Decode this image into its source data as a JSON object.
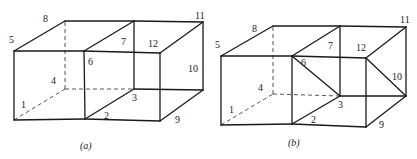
{
  "figures": [
    {
      "id": "a",
      "caption": "(a)",
      "caption_pos": [
        80,
        149
      ],
      "vertices": {
        "1": [
          14,
          120
        ],
        "2": [
          85,
          119
        ],
        "3": [
          134,
          89
        ],
        "4": [
          65,
          89
        ],
        "5": [
          14,
          51
        ],
        "6": [
          84,
          51
        ],
        "7": [
          134,
          21
        ],
        "8": [
          65,
          21
        ],
        "9": [
          160,
          121
        ],
        "10": [
          203,
          90
        ],
        "11": [
          203,
          22
        ],
        "12": [
          160,
          53
        ]
      },
      "labels": [
        {
          "text": "1",
          "x": 21,
          "y": 108
        },
        {
          "text": "2",
          "x": 104,
          "y": 119
        },
        {
          "text": "3",
          "x": 132,
          "y": 101
        },
        {
          "text": "4",
          "x": 51,
          "y": 84
        },
        {
          "text": "5",
          "x": 9,
          "y": 43
        },
        {
          "text": "6",
          "x": 88,
          "y": 65
        },
        {
          "text": "7",
          "x": 121,
          "y": 45
        },
        {
          "text": "8",
          "x": 43,
          "y": 22
        },
        {
          "text": "9",
          "x": 175,
          "y": 123
        },
        {
          "text": "10",
          "x": 188,
          "y": 72
        },
        {
          "text": "11",
          "x": 195,
          "y": 19
        },
        {
          "text": "12",
          "x": 148,
          "y": 47
        }
      ],
      "solid_edges": [
        [
          "5",
          "6"
        ],
        [
          "6",
          "12"
        ],
        [
          "5",
          "8"
        ],
        [
          "8",
          "7"
        ],
        [
          "7",
          "11"
        ],
        [
          "6",
          "7"
        ],
        [
          "12",
          "11"
        ],
        [
          "5",
          "1"
        ],
        [
          "6",
          "2"
        ],
        [
          "12",
          "9"
        ],
        [
          "7",
          "3"
        ],
        [
          "11",
          "10"
        ],
        [
          "1",
          "2"
        ],
        [
          "2",
          "9"
        ],
        [
          "2",
          "3"
        ],
        [
          "9",
          "10"
        ],
        [
          "3",
          "10"
        ]
      ],
      "hidden_edges": [
        [
          "1",
          "4"
        ],
        [
          "4",
          "8"
        ],
        [
          "4",
          "3"
        ]
      ],
      "diagonals": []
    },
    {
      "id": "b",
      "caption": "(b)",
      "caption_pos": [
        288,
        146
      ],
      "vertices": {
        "1": [
          221,
          125
        ],
        "2": [
          292,
          124
        ],
        "3": [
          340,
          96
        ],
        "4": [
          273,
          94
        ],
        "5": [
          221,
          56
        ],
        "6": [
          292,
          56
        ],
        "7": [
          340,
          26
        ],
        "8": [
          273,
          26
        ],
        "9": [
          366,
          127
        ],
        "10": [
          406,
          96
        ],
        "11": [
          406,
          27
        ],
        "12": [
          366,
          58
        ]
      },
      "labels": [
        {
          "text": "1",
          "x": 229,
          "y": 113
        },
        {
          "text": "2",
          "x": 311,
          "y": 123
        },
        {
          "text": "3",
          "x": 338,
          "y": 108
        },
        {
          "text": "4",
          "x": 258,
          "y": 91
        },
        {
          "text": "5",
          "x": 215,
          "y": 48
        },
        {
          "text": "6",
          "x": 301,
          "y": 66
        },
        {
          "text": "7",
          "x": 328,
          "y": 49
        },
        {
          "text": "8",
          "x": 252,
          "y": 32
        },
        {
          "text": "9",
          "x": 379,
          "y": 128
        },
        {
          "text": "10",
          "x": 392,
          "y": 80
        },
        {
          "text": "11",
          "x": 400,
          "y": 23
        },
        {
          "text": "12",
          "x": 356,
          "y": 51
        }
      ],
      "solid_edges": [
        [
          "5",
          "6"
        ],
        [
          "6",
          "12"
        ],
        [
          "5",
          "8"
        ],
        [
          "8",
          "7"
        ],
        [
          "7",
          "11"
        ],
        [
          "6",
          "7"
        ],
        [
          "12",
          "11"
        ],
        [
          "5",
          "1"
        ],
        [
          "6",
          "2"
        ],
        [
          "12",
          "9"
        ],
        [
          "7",
          "3"
        ],
        [
          "11",
          "10"
        ],
        [
          "1",
          "2"
        ],
        [
          "2",
          "9"
        ],
        [
          "2",
          "3"
        ],
        [
          "9",
          "10"
        ],
        [
          "3",
          "10"
        ]
      ],
      "hidden_edges": [
        [
          "1",
          "4"
        ],
        [
          "4",
          "8"
        ],
        [
          "4",
          "3"
        ]
      ],
      "diagonals": [
        [
          "6",
          "3"
        ],
        [
          "12",
          "10"
        ]
      ]
    }
  ]
}
